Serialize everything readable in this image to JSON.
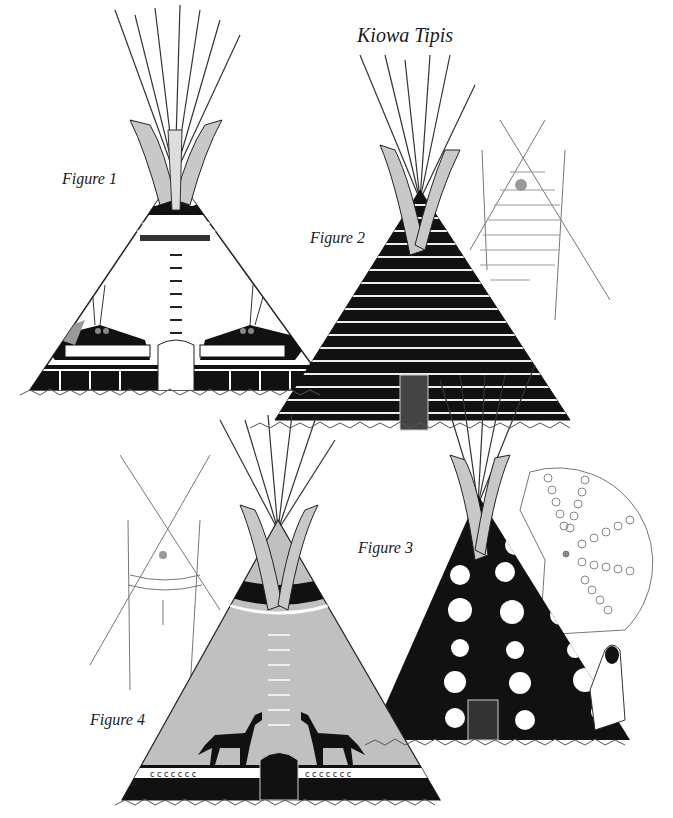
{
  "title": "Kiowa Tipis",
  "figures": [
    {
      "label": "Figure 1",
      "design": "white tipi with black dotted top band and two black water-monster figures"
    },
    {
      "label": "Figure 2",
      "design": "black tipi with horizontal white stripes"
    },
    {
      "label": "Figure 3",
      "design": "black tipi with large white circles"
    },
    {
      "label": "Figure 4",
      "design": "gray tipi with two black horses and black base band"
    }
  ],
  "colors": {
    "ink": "#111111",
    "gray_fill": "#bdbdbd",
    "light_gray": "#d6d6d6",
    "dot_accent": "#999999",
    "background": "#ffffff"
  }
}
